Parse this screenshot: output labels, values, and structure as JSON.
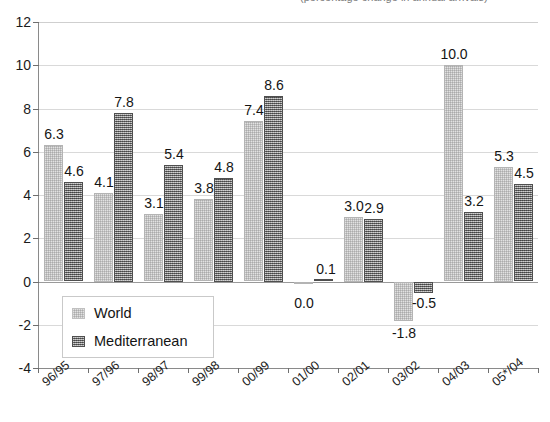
{
  "title_strip": {
    "cropped_text": "(percentage change in annual arrivals)"
  },
  "legend": {
    "position": "inside-lower-left",
    "items": [
      {
        "label": "World",
        "key": "world",
        "color": "#e0e0e0"
      },
      {
        "label": "Mediterranean",
        "key": "mediterranean",
        "color": "#7d7d7d"
      }
    ]
  },
  "axis": {
    "y_ticks": [
      "12",
      "10",
      "8",
      "6",
      "4",
      "2",
      "0",
      "-2",
      "-4"
    ],
    "x_ticks": [
      "96/95",
      "97/96",
      "98/97",
      "99/98",
      "00/99",
      "01/00",
      "02/01",
      "03/02",
      "04/03",
      "05*/04"
    ]
  },
  "chart_data": {
    "type": "bar",
    "title": "",
    "subtitle": "",
    "xlabel": "",
    "ylabel": "",
    "ylim": [
      -4,
      12
    ],
    "ytick_step": 2,
    "grid": true,
    "legend_position": "inside lower left",
    "categories": [
      "96/95",
      "97/96",
      "98/97",
      "99/98",
      "00/99",
      "01/00",
      "02/01",
      "03/02",
      "04/03",
      "05*/04"
    ],
    "series": [
      {
        "name": "World",
        "color": "#e0e0e0",
        "values": [
          6.3,
          4.1,
          3.1,
          3.8,
          7.4,
          0.0,
          3.0,
          -1.8,
          10.0,
          5.3
        ],
        "labels": [
          "6.3",
          "4.1",
          "3.1",
          "3.8",
          "7.4",
          "0.0",
          "3.0",
          "-1.8",
          "10.0",
          "5.3"
        ]
      },
      {
        "name": "Mediterranean",
        "color": "#7d7d7d",
        "values": [
          4.6,
          7.8,
          5.4,
          4.8,
          8.6,
          0.1,
          2.9,
          -0.5,
          3.2,
          4.5
        ],
        "labels": [
          "4.6",
          "7.8",
          "5.4",
          "4.8",
          "8.6",
          "0.1",
          "2.9",
          "-0.5",
          "3.2",
          "4.5"
        ]
      }
    ]
  }
}
